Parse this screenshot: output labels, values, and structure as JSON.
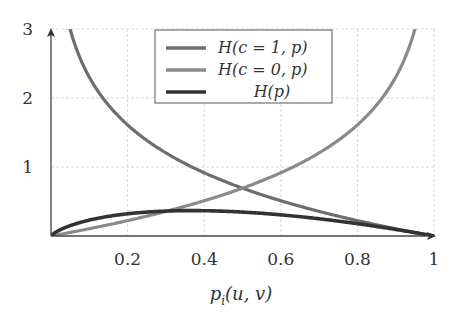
{
  "chart_data": {
    "type": "line",
    "title": "",
    "xlabel": "p_i(u,v)",
    "ylabel": "",
    "xlim": [
      0,
      1
    ],
    "ylim": [
      0,
      3
    ],
    "grid": true,
    "legend_position": "top-center",
    "x_ticks": [
      "0.2",
      "0.4",
      "0.6",
      "0.8",
      "1"
    ],
    "y_ticks": [
      "1",
      "2",
      "3"
    ],
    "series": [
      {
        "name": "H(c = 1, p)",
        "formula": "-ln(p)",
        "color": "#6e6e6e",
        "x": [
          0.05,
          0.1,
          0.2,
          0.3,
          0.4,
          0.5,
          0.6,
          0.7,
          0.8,
          0.9,
          1.0
        ],
        "y": [
          3.0,
          2.3,
          1.61,
          1.2,
          0.92,
          0.69,
          0.51,
          0.36,
          0.22,
          0.11,
          0.0
        ]
      },
      {
        "name": "H(c = 0, p)",
        "formula": "-ln(1-p)",
        "color": "#8a8a8a",
        "x": [
          0.0,
          0.1,
          0.2,
          0.3,
          0.4,
          0.5,
          0.6,
          0.7,
          0.8,
          0.9,
          0.95
        ],
        "y": [
          0.0,
          0.11,
          0.22,
          0.36,
          0.51,
          0.69,
          0.92,
          1.2,
          1.61,
          2.3,
          3.0
        ]
      },
      {
        "name": "H(p)",
        "formula": "-p ln(p)",
        "color": "#333333",
        "x": [
          0.0,
          0.1,
          0.2,
          0.3,
          0.37,
          0.5,
          0.6,
          0.7,
          0.8,
          0.9,
          1.0
        ],
        "y": [
          0.0,
          0.23,
          0.32,
          0.36,
          0.37,
          0.35,
          0.31,
          0.25,
          0.18,
          0.09,
          0.0
        ]
      }
    ]
  },
  "legend": {
    "items": [
      "H(c = 1, p)",
      "H(c = 0, p)",
      "H(p)"
    ]
  },
  "axes": {
    "xlabel": "p",
    "xlabel_sub": "i",
    "xlabel_rest": "(u, v)"
  }
}
